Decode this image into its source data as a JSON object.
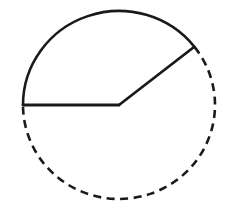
{
  "figure": {
    "background_color": "#ffffff",
    "stroke_color": "#1a1a1a",
    "stroke_width": 2.6,
    "geometry": {
      "center_x": 119,
      "center_y": 105,
      "radius": 96,
      "radius_x": 96,
      "radius_y": 94
    },
    "radii": [
      {
        "name": "horizontal-radius",
        "angle_degrees": 180,
        "from_x": 119,
        "from_y": 105,
        "to_x": 23,
        "to_y": 105,
        "style": "solid"
      },
      {
        "name": "upper-right-radius",
        "angle_degrees": 38,
        "from_x": 119,
        "from_y": 105,
        "to_x": 194,
        "to_y": 47,
        "style": "solid"
      }
    ],
    "arcs": [
      {
        "name": "solid-major-arc",
        "style": "solid",
        "start_angle_degrees": 180,
        "end_angle_degrees": 38,
        "sweep_degrees": 142,
        "direction": "counterclockwise"
      },
      {
        "name": "dashed-minor-arc",
        "style": "dashed",
        "start_angle_degrees": 38,
        "end_angle_degrees": 180,
        "sweep_degrees": 218,
        "direction": "clockwise",
        "dash_length": 8,
        "dash_gap": 5.5
      }
    ],
    "sector": {
      "name": "central-angle",
      "angle_degrees": 142,
      "label": ""
    }
  }
}
